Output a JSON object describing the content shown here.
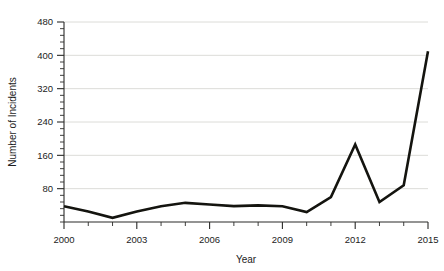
{
  "chart_data": {
    "type": "line",
    "title": "",
    "xlabel": "Year",
    "ylabel": "Number of Incidents",
    "x": [
      2000,
      2001,
      2002,
      2003,
      2004,
      2005,
      2006,
      2007,
      2008,
      2009,
      2010,
      2011,
      2012,
      2013,
      2014,
      2015
    ],
    "values": [
      38,
      25,
      10,
      25,
      38,
      46,
      42,
      38,
      40,
      38,
      24,
      60,
      186,
      48,
      88,
      410
    ],
    "series": [
      {
        "name": "Number of Incidents",
        "values": [
          38,
          25,
          10,
          25,
          38,
          46,
          42,
          38,
          40,
          38,
          24,
          60,
          186,
          48,
          88,
          410
        ]
      }
    ],
    "xlim": [
      2000,
      2015
    ],
    "ylim": [
      0,
      480
    ],
    "y_ticks": [
      80,
      160,
      240,
      320,
      400,
      480
    ],
    "y_tick_labels": [
      "80",
      "160",
      "240",
      "320",
      "400",
      "480"
    ],
    "y_minor_tick_step": 16,
    "x_ticks": [
      2000,
      2001,
      2002,
      2003,
      2004,
      2005,
      2006,
      2007,
      2008,
      2009,
      2010,
      2011,
      2012,
      2013,
      2014,
      2015
    ],
    "x_tick_labels": [
      "2000",
      "2003",
      "2006",
      "2009",
      "2012",
      "2015"
    ],
    "x_labeled_ticks": [
      2000,
      2003,
      2006,
      2009,
      2012,
      2015
    ],
    "grid": "horizontal",
    "legend": "none",
    "line_color": "#14140f",
    "grid_color": "#d8d8d4",
    "axis_color": "#2a2a28",
    "background_color": "#ffffff"
  },
  "labels": {
    "y_axis_title": "Number of Incidents",
    "x_axis_title": "Year"
  }
}
